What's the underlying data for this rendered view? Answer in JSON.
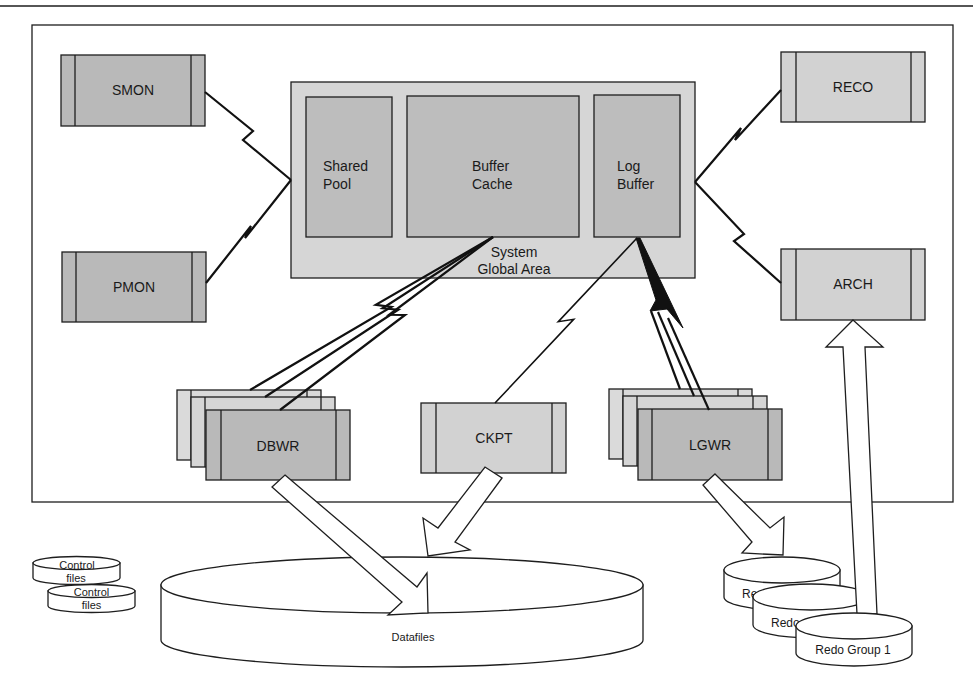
{
  "processes": {
    "smon": "SMON",
    "pmon": "PMON",
    "reco": "RECO",
    "arch": "ARCH",
    "dbwr": "DBWR",
    "ckpt": "CKPT",
    "lgwr": "LGWR"
  },
  "sga": {
    "label": [
      "System",
      "Global Area"
    ],
    "shared_pool": [
      "Shared",
      "Pool"
    ],
    "buffer_cache": [
      "Buffer",
      "Cache"
    ],
    "log_buffer": [
      "Log",
      "Buffer"
    ]
  },
  "storage": {
    "datafiles": "Datafiles",
    "control_files": [
      [
        "Control",
        "files"
      ],
      [
        "Control",
        "files"
      ]
    ],
    "redo_groups": [
      "Re",
      "Redo",
      "Redo Group 1"
    ]
  },
  "connections": [
    {
      "from": "SMON",
      "to": "System Global Area",
      "style": "lightning"
    },
    {
      "from": "PMON",
      "to": "System Global Area",
      "style": "lightning"
    },
    {
      "from": "System Global Area",
      "to": "RECO",
      "style": "lightning"
    },
    {
      "from": "System Global Area",
      "to": "ARCH",
      "style": "lightning"
    },
    {
      "from": "Buffer Cache",
      "to": "DBWR",
      "style": "lightning-multi"
    },
    {
      "from": "Log Buffer",
      "to": "CKPT",
      "style": "lightning"
    },
    {
      "from": "Log Buffer",
      "to": "LGWR",
      "style": "lightning-multi"
    },
    {
      "from": "DBWR",
      "to": "Datafiles",
      "style": "block-arrow"
    },
    {
      "from": "CKPT",
      "to": "Datafiles",
      "style": "block-arrow"
    },
    {
      "from": "LGWR",
      "to": "Redo Groups",
      "style": "block-arrow"
    },
    {
      "from": "Redo Group 1",
      "to": "ARCH",
      "style": "block-arrow"
    }
  ],
  "colors": {
    "process_dark": "#b9b9b9",
    "process_light": "#d2d2d2",
    "sga_outer": "#d6d6d6",
    "sga_inner": "#bdbdbd",
    "line": "#1e1e1e"
  }
}
